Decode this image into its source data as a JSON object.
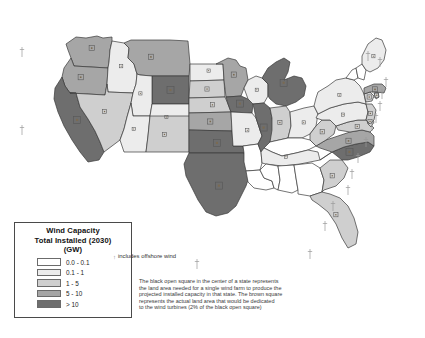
{
  "figure": {
    "kind": "choropleth-map",
    "region": "United States"
  },
  "legend": {
    "title_line1": "Wind Capacity",
    "title_line2": "Total Installed (2030)",
    "title_line3": "(GW)",
    "classes": [
      {
        "label": "0.0 - 0.1",
        "color": "#ffffff"
      },
      {
        "label": "0.1 - 1",
        "color": "#ececec"
      },
      {
        "label": "1 - 5",
        "color": "#cfcfcf"
      },
      {
        "label": "5 - 10",
        "color": "#a6a6a6"
      },
      {
        "label": "> 10",
        "color": "#6e6e6e"
      }
    ]
  },
  "offshore_note": {
    "marker": "↑",
    "text": "includes offshore wind"
  },
  "notes": {
    "line1": "The black open square in the center of a state represents",
    "line2": "the land area needed for a single wind farm to produce the",
    "line3": "projected installed capacity in that state.  The brown square",
    "line4": "represents the actual land area that would be dedicated",
    "line5": "to the wind turbines (2% of the black open square)"
  },
  "chart_data": {
    "type": "heatmap",
    "title": "Wind Capacity Total Installed (2030) (GW)",
    "xlabel": "",
    "ylabel": "",
    "legend_position": "bottom-left",
    "grid": false,
    "categories": [
      "0.0 - 0.1",
      "0.1 - 1",
      "1 - 5",
      "5 - 10",
      "> 10"
    ],
    "colors": [
      "#ffffff",
      "#ececec",
      "#cfcfcf",
      "#a6a6a6",
      "#6e6e6e"
    ],
    "states": [
      {
        "name": "Washington",
        "abbr": "WA",
        "class": "5 - 10",
        "offshore": false
      },
      {
        "name": "Oregon",
        "abbr": "OR",
        "class": "5 - 10",
        "offshore": true
      },
      {
        "name": "California",
        "abbr": "CA",
        "class": "> 10",
        "offshore": true
      },
      {
        "name": "Idaho",
        "abbr": "ID",
        "class": "0.1 - 1",
        "offshore": false
      },
      {
        "name": "Nevada",
        "abbr": "NV",
        "class": "1 - 5",
        "offshore": false
      },
      {
        "name": "Montana",
        "abbr": "MT",
        "class": "5 - 10",
        "offshore": false
      },
      {
        "name": "Wyoming",
        "abbr": "WY",
        "class": "> 10",
        "offshore": false
      },
      {
        "name": "Utah",
        "abbr": "UT",
        "class": "0.1 - 1",
        "offshore": false
      },
      {
        "name": "Colorado",
        "abbr": "CO",
        "class": "0.1 - 1",
        "offshore": false
      },
      {
        "name": "Arizona",
        "abbr": "AZ",
        "class": "0.1 - 1",
        "offshore": false
      },
      {
        "name": "New Mexico",
        "abbr": "NM",
        "class": "1 - 5",
        "offshore": false
      },
      {
        "name": "North Dakota",
        "abbr": "ND",
        "class": "0.1 - 1",
        "offshore": false
      },
      {
        "name": "South Dakota",
        "abbr": "SD",
        "class": "1 - 5",
        "offshore": false
      },
      {
        "name": "Nebraska",
        "abbr": "NE",
        "class": "1 - 5",
        "offshore": false
      },
      {
        "name": "Kansas",
        "abbr": "KS",
        "class": "5 - 10",
        "offshore": false
      },
      {
        "name": "Oklahoma",
        "abbr": "OK",
        "class": "> 10",
        "offshore": false
      },
      {
        "name": "Texas",
        "abbr": "TX",
        "class": "> 10",
        "offshore": true
      },
      {
        "name": "Minnesota",
        "abbr": "MN",
        "class": "5 - 10",
        "offshore": false
      },
      {
        "name": "Iowa",
        "abbr": "IA",
        "class": "> 10",
        "offshore": false
      },
      {
        "name": "Missouri",
        "abbr": "MO",
        "class": "0.1 - 1",
        "offshore": false
      },
      {
        "name": "Arkansas",
        "abbr": "AR",
        "class": "0.0 - 0.1",
        "offshore": false
      },
      {
        "name": "Louisiana",
        "abbr": "LA",
        "class": "0.0 - 0.1",
        "offshore": false
      },
      {
        "name": "Wisconsin",
        "abbr": "WI",
        "class": "0.1 - 1",
        "offshore": false
      },
      {
        "name": "Illinois",
        "abbr": "IL",
        "class": "> 10",
        "offshore": false
      },
      {
        "name": "Michigan",
        "abbr": "MI",
        "class": "> 10",
        "offshore": false
      },
      {
        "name": "Indiana",
        "abbr": "IN",
        "class": "1 - 5",
        "offshore": false
      },
      {
        "name": "Ohio",
        "abbr": "OH",
        "class": "0.1 - 1",
        "offshore": false
      },
      {
        "name": "Kentucky",
        "abbr": "KY",
        "class": "0.0 - 0.1",
        "offshore": false
      },
      {
        "name": "Tennessee",
        "abbr": "TN",
        "class": "0.1 - 1",
        "offshore": false
      },
      {
        "name": "Mississippi",
        "abbr": "MS",
        "class": "0.0 - 0.1",
        "offshore": false
      },
      {
        "name": "Alabama",
        "abbr": "AL",
        "class": "0.0 - 0.1",
        "offshore": false
      },
      {
        "name": "Georgia",
        "abbr": "GA",
        "class": "0.0 - 0.1",
        "offshore": false
      },
      {
        "name": "Florida",
        "abbr": "FL",
        "class": "1 - 5",
        "offshore": true
      },
      {
        "name": "South Carolina",
        "abbr": "SC",
        "class": "1 - 5",
        "offshore": true
      },
      {
        "name": "North Carolina",
        "abbr": "NC",
        "class": "> 10",
        "offshore": true
      },
      {
        "name": "Virginia",
        "abbr": "VA",
        "class": "5 - 10",
        "offshore": true
      },
      {
        "name": "West Virginia",
        "abbr": "WV",
        "class": "1 - 5",
        "offshore": false
      },
      {
        "name": "Maryland",
        "abbr": "MD",
        "class": "1 - 5",
        "offshore": true
      },
      {
        "name": "Delaware",
        "abbr": "DE",
        "class": "1 - 5",
        "offshore": true
      },
      {
        "name": "Pennsylvania",
        "abbr": "PA",
        "class": "0.1 - 1",
        "offshore": false
      },
      {
        "name": "New Jersey",
        "abbr": "NJ",
        "class": "1 - 5",
        "offshore": true
      },
      {
        "name": "New York",
        "abbr": "NY",
        "class": "0.1 - 1",
        "offshore": true
      },
      {
        "name": "Connecticut",
        "abbr": "CT",
        "class": "1 - 5",
        "offshore": true
      },
      {
        "name": "Rhode Island",
        "abbr": "RI",
        "class": "1 - 5",
        "offshore": true
      },
      {
        "name": "Massachusetts",
        "abbr": "MA",
        "class": "5 - 10",
        "offshore": true
      },
      {
        "name": "Vermont",
        "abbr": "VT",
        "class": "0.0 - 0.1",
        "offshore": false
      },
      {
        "name": "New Hampshire",
        "abbr": "NH",
        "class": "0.0 - 0.1",
        "offshore": true
      },
      {
        "name": "Maine",
        "abbr": "ME",
        "class": "0.1 - 1",
        "offshore": true
      }
    ]
  }
}
